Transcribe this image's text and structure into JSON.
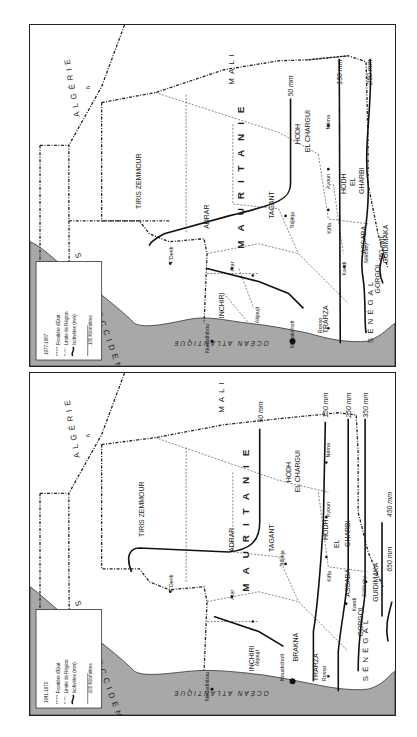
{
  "maps": [
    {
      "id": "top",
      "period": "1977-1987",
      "legend": {
        "period": "1977-1987",
        "items": [
          "Frontière d'Etat",
          "Limite de Région",
          "Isohyètes (mm)"
        ],
        "scale": "100 Kilomètres",
        "scale_start": "0",
        "north": "N"
      },
      "countries": {
        "algerie": "ALGÉRIE",
        "mali": "MALI",
        "sahara": "SAHARA OCCIDENTAL",
        "senegal": "SÉNÉGAL",
        "ocean": "OCÉAN ATLANTIQUE",
        "mauritanie": "MAURITANIE"
      },
      "regions": {
        "tiris": "TIRIS ZEMMOUR",
        "adrar": "ADRAR",
        "tagant": "TAGANT",
        "hodh_ec1": "HODH",
        "hodh_ec2": "EL CHARGUI",
        "hodh_eg1": "HODH",
        "hodh_eg2": "EL",
        "hodh_eg3": "GHARBI",
        "assaba": "ASSABA",
        "guidimaka": "GUIDIMAKA",
        "gorgol": "GORGOL",
        "brakna": "BRAKNA",
        "trarza": "TRARZA",
        "inchiri": "INCHIRI"
      },
      "cities": {
        "nouadhibou": "Nouadhibou",
        "nouakchott": "Nouakchott",
        "akjoujt": "Akjoujt",
        "atar": "Atar",
        "fderik": "F'Derik",
        "tidjikja": "Tidjikja",
        "kiffa": "Kiffa",
        "ayoun": "Ayoun",
        "nema": "Néma",
        "kaedi": "Kaedi",
        "selibaby": "Sélibaby",
        "rosso": "Rosso"
      },
      "isohyets": [
        "50 mm",
        "150 mm",
        "250 mm",
        "350 mm"
      ]
    },
    {
      "id": "bottom",
      "period": "1941-1970",
      "legend": {
        "period": "1941-1970",
        "items": [
          "Frontière d'Etat",
          "Limite de Région",
          "Isohyètes (mm)"
        ],
        "scale": "100 Kilomètres",
        "scale_start": "0",
        "north": "N"
      },
      "countries": {
        "algerie": "ALGÉRIE",
        "mali": "MALI",
        "sahara": "SAHARA OCCIDENTAL",
        "senegal": "SÉNÉGAL",
        "ocean": "OCÉAN ATLANTIQUE",
        "mauritanie": "MAURITANIE"
      },
      "regions": {
        "tiris": "TIRIS ZEMMOUR",
        "adrar": "ADRAR",
        "tagant": "TAGANT",
        "hodh_ec1": "HODH",
        "hodh_ec2": "EL CHARGUI",
        "hodh_eg1": "HODH",
        "hodh_eg2": "EL",
        "hodh_eg3": "GHARBI",
        "assaba": "ASSABA",
        "guidimaka": "GUIDIMAKA",
        "gorgol": "GORGOL",
        "brakna": "BRAKNA",
        "trarza": "TRARZA",
        "inchiri": "INCHIRI"
      },
      "cities": {
        "nouadhibou": "Nouadhibou",
        "nouakchott": "Nouakchott",
        "akjoujt": "Akjoujt",
        "atar": "Atar",
        "fderik": "F'Derik",
        "tidjikja": "Tidjikja",
        "kiffa": "Kiffa",
        "ayoun": "Ayoun",
        "nema": "Néma",
        "kaedi": "Kaedi",
        "selibaby": "Sélibaby",
        "rosso": "Rosso"
      },
      "isohyets": [
        "50 mm",
        "150 mm",
        "250 mm",
        "350 mm",
        "450 mm",
        "650 mm"
      ]
    }
  ],
  "colors": {
    "sea": "#a8a8a8",
    "land": "#ffffff",
    "line": "#222222"
  }
}
